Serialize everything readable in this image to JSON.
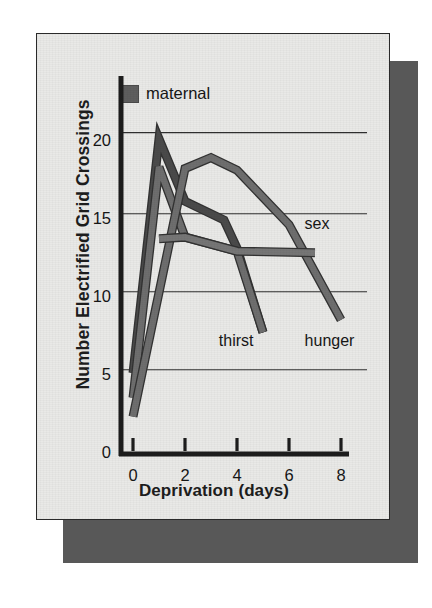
{
  "figure": {
    "background_color": "#e9e9e7",
    "shadow_color": "#585858",
    "border_color": "#2a2a2a"
  },
  "legend": {
    "swatch_name": "maternal-swatch",
    "label": "maternal",
    "swatch_color": "#5e5e5e"
  },
  "chart_data": {
    "type": "line",
    "title": "",
    "xlabel": "Deprivation (days)",
    "ylabel": "Number Electrified Grid Crossings",
    "xlim": [
      0,
      8
    ],
    "ylim": [
      0,
      21
    ],
    "xticks": [
      0,
      2,
      4,
      6,
      8
    ],
    "xtick_labels": [
      "0",
      "2",
      "4",
      "6",
      "8"
    ],
    "yticks": [
      0,
      5,
      10,
      15,
      20
    ],
    "ytick_labels": [
      "0",
      "5",
      "10",
      "15",
      "20"
    ],
    "gridlines_y": [
      5.4,
      10.4,
      15.4,
      20.6
    ],
    "grid": true,
    "grid_axis": "y",
    "legend_position": "top-left",
    "series": [
      {
        "name": "maternal",
        "color": "#4a4a4a",
        "label_shown_in_legend": true,
        "x": [
          0,
          1,
          2,
          3.5,
          4,
          5
        ],
        "y": [
          5.2,
          20.2,
          16.2,
          15.0,
          13.2,
          7.8
        ]
      },
      {
        "name": "thirst",
        "color": "#6e6e6e",
        "label_shown_in_legend": false,
        "x": [
          0,
          1,
          2,
          4,
          5
        ],
        "y": [
          3.6,
          18.4,
          13.9,
          13.0,
          7.8
        ]
      },
      {
        "name": "hunger",
        "color": "#6e6e6e",
        "label_shown_in_legend": false,
        "x": [
          0,
          2,
          3,
          4,
          6,
          8
        ],
        "y": [
          2.4,
          18.3,
          19.0,
          18.2,
          14.7,
          8.6
        ]
      },
      {
        "name": "sex",
        "color": "#767676",
        "label_shown_in_legend": false,
        "x": [
          1,
          2,
          4,
          7
        ],
        "y": [
          13.8,
          13.9,
          13.0,
          12.9
        ]
      }
    ],
    "annotations": [
      {
        "text": "sex",
        "x": 6.6,
        "y": 14.6
      },
      {
        "text": "thirst",
        "x": 3.3,
        "y": 7.1
      },
      {
        "text": "hunger",
        "x": 6.6,
        "y": 7.1
      }
    ]
  }
}
